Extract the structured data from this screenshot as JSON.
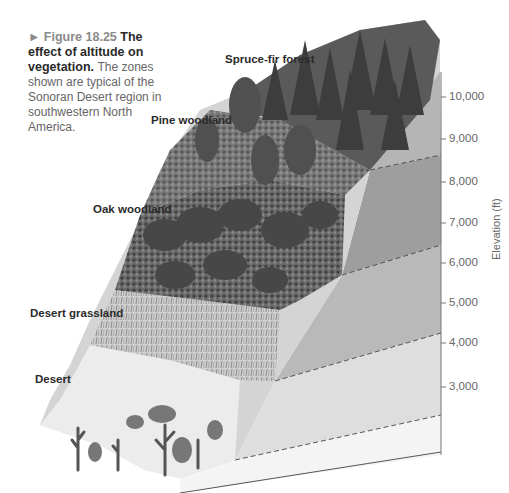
{
  "caption": {
    "figure_number": "► Figure 18.25",
    "title": "The effect of altitude on vegetation.",
    "description": "The zones shown are typical of the Sonoran Desert region in southwestern North America."
  },
  "zones": [
    {
      "label": "Spruce-fir forest",
      "range_ft": "9,000-10,500"
    },
    {
      "label": "Pine woodland",
      "range_ft": "7,500-9,000"
    },
    {
      "label": "Oak woodland",
      "range_ft": "5,500-7,500"
    },
    {
      "label": "Desert grassland",
      "range_ft": "4,000-5,500"
    },
    {
      "label": "Desert",
      "range_ft": "3,000-4,000"
    }
  ],
  "axis": {
    "title": "Elevation (ft)",
    "ticks": [
      "10,000",
      "9,000",
      "8,000",
      "7,000",
      "6,000",
      "5,000",
      "4,000",
      "3,000"
    ]
  },
  "colors": {
    "band_spruce": "#b5b5b5",
    "band_pine": "#9e9e9e",
    "band_oak": "#b9b9b9",
    "band_grass": "#dedede",
    "band_desert": "#f4f4f4",
    "axis": "#777777",
    "vegetation_dark": "#4a4a4a",
    "vegetation_mid": "#777777"
  }
}
